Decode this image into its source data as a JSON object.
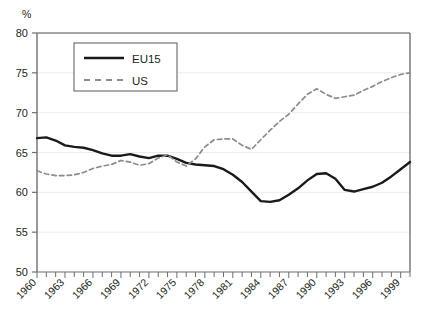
{
  "chart_data": {
    "type": "line",
    "title": "",
    "subtitle": "",
    "xlabel": "",
    "ylabel": "",
    "unit_label": "%",
    "ylim": [
      50,
      80
    ],
    "yticks": [
      50,
      55,
      60,
      65,
      70,
      75,
      80
    ],
    "ytick_labels": [
      "50",
      "55",
      "60",
      "65",
      "70",
      "75",
      "80"
    ],
    "xlim": [
      1960,
      2000
    ],
    "xticks": [
      1960,
      1961,
      1962,
      1963,
      1964,
      1965,
      1966,
      1967,
      1968,
      1969,
      1970,
      1971,
      1972,
      1973,
      1974,
      1975,
      1976,
      1977,
      1978,
      1979,
      1980,
      1981,
      1982,
      1983,
      1984,
      1985,
      1986,
      1987,
      1988,
      1989,
      1990,
      1991,
      1992,
      1993,
      1994,
      1995,
      1996,
      1997,
      1998,
      1999,
      2000
    ],
    "xtick_labels_shown": [
      "1960",
      "1963",
      "1966",
      "1969",
      "1972",
      "1975",
      "1978",
      "1981",
      "1984",
      "1987",
      "1990",
      "1993",
      "1996",
      "1999"
    ],
    "xtick_label_years": [
      1960,
      1963,
      1966,
      1969,
      1972,
      1975,
      1978,
      1981,
      1984,
      1987,
      1990,
      1993,
      1996,
      1999
    ],
    "xtick_label_rotation": -45,
    "grid": true,
    "grid_axis": "y",
    "legend_position": "upper-left-inside",
    "x": [
      1960,
      1961,
      1962,
      1963,
      1964,
      1965,
      1966,
      1967,
      1968,
      1969,
      1970,
      1971,
      1972,
      1973,
      1974,
      1975,
      1976,
      1977,
      1978,
      1979,
      1980,
      1981,
      1982,
      1983,
      1984,
      1985,
      1986,
      1987,
      1988,
      1989,
      1990,
      1991,
      1992,
      1993,
      1994,
      1995,
      1996,
      1997,
      1998,
      1999,
      2000
    ],
    "series": [
      {
        "name": "EU15",
        "style": "solid",
        "color": "#1a1a1a",
        "values": [
          66.8,
          66.9,
          66.5,
          65.9,
          65.7,
          65.6,
          65.3,
          64.9,
          64.6,
          64.6,
          64.8,
          64.5,
          64.3,
          64.6,
          64.6,
          64.2,
          63.7,
          63.5,
          63.4,
          63.3,
          62.9,
          62.2,
          61.3,
          60.1,
          58.9,
          58.8,
          59.0,
          59.7,
          60.5,
          61.5,
          62.3,
          62.4,
          61.7,
          60.3,
          60.1,
          60.4,
          60.7,
          61.2,
          62.0,
          62.9,
          63.8
        ]
      },
      {
        "name": "US",
        "style": "dashed",
        "color": "#8c8c8c",
        "values": [
          62.7,
          62.3,
          62.1,
          62.1,
          62.2,
          62.5,
          63.0,
          63.3,
          63.5,
          64.0,
          63.8,
          63.4,
          63.6,
          64.3,
          64.7,
          63.8,
          63.3,
          64.2,
          65.7,
          66.6,
          66.7,
          66.7,
          65.9,
          65.4,
          66.6,
          67.8,
          68.9,
          69.8,
          71.1,
          72.3,
          73.0,
          72.3,
          71.8,
          72.0,
          72.2,
          72.8,
          73.3,
          73.9,
          74.4,
          74.8,
          75.0
        ]
      }
    ]
  },
  "legend": {
    "items": [
      {
        "label": "EU15"
      },
      {
        "label": "US"
      }
    ]
  },
  "colors": {
    "eu15": "#1a1a1a",
    "us": "#8c8c8c",
    "axis": "#6d6e71",
    "grid": "#ececec",
    "text": "#231f20",
    "frame": "#58595b"
  }
}
